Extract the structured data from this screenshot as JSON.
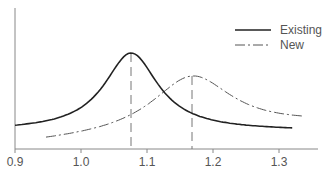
{
  "chart_data": {
    "type": "line",
    "title": "",
    "xlabel": "",
    "ylabel": "",
    "xlim": [
      0.9,
      1.34
    ],
    "x_ticks": [
      "0.9",
      "1.0",
      "1.1",
      "1.2",
      "1.3"
    ],
    "y_ticks": [],
    "grid": false,
    "legend_position": "upper right",
    "series": [
      {
        "name": "Existing",
        "style": "solid",
        "color": "#222222",
        "x_range": [
          0.9,
          1.32
        ],
        "peak_x": 1.076,
        "peak_relative_height": 1.0,
        "shape": "lorentzian",
        "hwhm": 0.05,
        "marker_line_x": 1.076,
        "points": [
          [
            0.9,
            0.0
          ],
          [
            0.95,
            0.08
          ],
          [
            1.0,
            0.3
          ],
          [
            1.04,
            0.72
          ],
          [
            1.076,
            1.0
          ],
          [
            1.1,
            0.8
          ],
          [
            1.15,
            0.35
          ],
          [
            1.2,
            0.12
          ],
          [
            1.25,
            0.05
          ],
          [
            1.32,
            0.02
          ]
        ]
      },
      {
        "name": "New",
        "style": "dash-dot",
        "color": "#555555",
        "x_range": [
          0.947,
          1.335
        ],
        "peak_x": 1.168,
        "peak_relative_height": 0.7,
        "shape": "lorentzian",
        "hwhm": 0.085,
        "marker_line_x": 1.168,
        "points": [
          [
            0.947,
            -0.06
          ],
          [
            1.0,
            0.05
          ],
          [
            1.05,
            0.17
          ],
          [
            1.1,
            0.38
          ],
          [
            1.168,
            0.7
          ],
          [
            1.2,
            0.6
          ],
          [
            1.25,
            0.35
          ],
          [
            1.3,
            0.15
          ],
          [
            1.335,
            0.08
          ]
        ]
      }
    ]
  },
  "legend": {
    "items": [
      {
        "label": "Existing",
        "style": "solid"
      },
      {
        "label": "New",
        "style": "dash-dot"
      }
    ]
  },
  "axis": {
    "x_tick_labels": [
      "0.9",
      "1.0",
      "1.1",
      "1.2",
      "1.3"
    ]
  }
}
